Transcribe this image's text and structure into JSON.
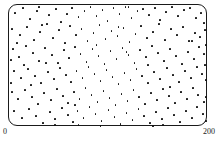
{
  "figure": {
    "kind": "scatter-plot",
    "frame_shape": "rounded-rectangle",
    "point_color": "#111111",
    "frame_color": "#1a1a1a",
    "background_color": "#ffffff"
  },
  "axis": {
    "x_min_label": "0",
    "x_max_label": "200"
  },
  "caption": {
    "text": "— —— · ——",
    "note": "cropped"
  },
  "chart_data": {
    "type": "scatter",
    "title": "",
    "xlabel": "",
    "ylabel": "",
    "xlim": [
      0,
      200
    ],
    "ylim": [
      0,
      122
    ],
    "grid": false,
    "legend": null,
    "tick_labels": {
      "x": [
        "0",
        "200"
      ],
      "y": []
    },
    "n_points": 232,
    "points": [
      [
        6,
        8
      ],
      [
        14,
        3
      ],
      [
        21,
        14
      ],
      [
        28,
        6
      ],
      [
        33,
        20
      ],
      [
        40,
        10
      ],
      [
        47,
        4
      ],
      [
        52,
        17
      ],
      [
        58,
        9
      ],
      [
        63,
        3
      ],
      [
        70,
        12
      ],
      [
        76,
        6
      ],
      [
        82,
        2
      ],
      [
        88,
        11
      ],
      [
        94,
        5
      ],
      [
        99,
        16
      ],
      [
        105,
        3
      ],
      [
        111,
        9
      ],
      [
        117,
        2
      ],
      [
        123,
        13
      ],
      [
        129,
        6
      ],
      [
        135,
        4
      ],
      [
        141,
        10
      ],
      [
        147,
        3
      ],
      [
        152,
        15
      ],
      [
        158,
        7
      ],
      [
        164,
        2
      ],
      [
        170,
        11
      ],
      [
        176,
        5
      ],
      [
        182,
        3
      ],
      [
        188,
        13
      ],
      [
        193,
        8
      ],
      [
        196,
        18
      ],
      [
        3,
        24
      ],
      [
        11,
        30
      ],
      [
        18,
        22
      ],
      [
        25,
        35
      ],
      [
        31,
        27
      ],
      [
        38,
        19
      ],
      [
        44,
        33
      ],
      [
        50,
        25
      ],
      [
        56,
        38
      ],
      [
        61,
        21
      ],
      [
        67,
        30
      ],
      [
        73,
        24
      ],
      [
        79,
        36
      ],
      [
        85,
        28
      ],
      [
        91,
        20
      ],
      [
        97,
        34
      ],
      [
        103,
        26
      ],
      [
        109,
        31
      ],
      [
        115,
        23
      ],
      [
        121,
        37
      ],
      [
        127,
        29
      ],
      [
        133,
        21
      ],
      [
        139,
        33
      ],
      [
        145,
        27
      ],
      [
        151,
        19
      ],
      [
        157,
        35
      ],
      [
        163,
        24
      ],
      [
        169,
        30
      ],
      [
        175,
        22
      ],
      [
        181,
        36
      ],
      [
        187,
        28
      ],
      [
        192,
        32
      ],
      [
        197,
        25
      ],
      [
        4,
        44
      ],
      [
        10,
        52
      ],
      [
        17,
        41
      ],
      [
        24,
        48
      ],
      [
        30,
        56
      ],
      [
        36,
        43
      ],
      [
        43,
        50
      ],
      [
        49,
        58
      ],
      [
        55,
        45
      ],
      [
        60,
        53
      ],
      [
        66,
        42
      ],
      [
        72,
        49
      ],
      [
        78,
        57
      ],
      [
        84,
        44
      ],
      [
        90,
        51
      ],
      [
        96,
        59
      ],
      [
        102,
        46
      ],
      [
        108,
        54
      ],
      [
        114,
        43
      ],
      [
        120,
        50
      ],
      [
        126,
        58
      ],
      [
        132,
        45
      ],
      [
        138,
        52
      ],
      [
        144,
        41
      ],
      [
        150,
        48
      ],
      [
        156,
        56
      ],
      [
        162,
        44
      ],
      [
        168,
        51
      ],
      [
        174,
        59
      ],
      [
        180,
        47
      ],
      [
        186,
        54
      ],
      [
        191,
        42
      ],
      [
        196,
        49
      ],
      [
        5,
        66
      ],
      [
        12,
        73
      ],
      [
        19,
        64
      ],
      [
        26,
        71
      ],
      [
        32,
        78
      ],
      [
        39,
        67
      ],
      [
        45,
        74
      ],
      [
        51,
        63
      ],
      [
        57,
        70
      ],
      [
        62,
        77
      ],
      [
        68,
        66
      ],
      [
        74,
        73
      ],
      [
        80,
        62
      ],
      [
        86,
        69
      ],
      [
        92,
        76
      ],
      [
        98,
        65
      ],
      [
        104,
        72
      ],
      [
        110,
        79
      ],
      [
        116,
        68
      ],
      [
        122,
        75
      ],
      [
        128,
        64
      ],
      [
        134,
        71
      ],
      [
        140,
        78
      ],
      [
        146,
        67
      ],
      [
        152,
        74
      ],
      [
        159,
        63
      ],
      [
        165,
        70
      ],
      [
        171,
        77
      ],
      [
        177,
        66
      ],
      [
        183,
        73
      ],
      [
        189,
        62
      ],
      [
        194,
        69
      ],
      [
        198,
        75
      ],
      [
        3,
        87
      ],
      [
        9,
        94
      ],
      [
        16,
        85
      ],
      [
        23,
        92
      ],
      [
        29,
        99
      ],
      [
        35,
        88
      ],
      [
        42,
        95
      ],
      [
        48,
        84
      ],
      [
        54,
        91
      ],
      [
        59,
        98
      ],
      [
        65,
        87
      ],
      [
        71,
        94
      ],
      [
        77,
        83
      ],
      [
        83,
        90
      ],
      [
        89,
        97
      ],
      [
        95,
        86
      ],
      [
        101,
        93
      ],
      [
        107,
        100
      ],
      [
        113,
        89
      ],
      [
        119,
        96
      ],
      [
        125,
        85
      ],
      [
        131,
        92
      ],
      [
        137,
        99
      ],
      [
        143,
        88
      ],
      [
        149,
        95
      ],
      [
        155,
        84
      ],
      [
        161,
        91
      ],
      [
        167,
        98
      ],
      [
        173,
        87
      ],
      [
        179,
        94
      ],
      [
        185,
        83
      ],
      [
        190,
        90
      ],
      [
        196,
        97
      ],
      [
        5,
        106
      ],
      [
        13,
        113
      ],
      [
        20,
        104
      ],
      [
        27,
        111
      ],
      [
        34,
        118
      ],
      [
        41,
        107
      ],
      [
        46,
        114
      ],
      [
        53,
        103
      ],
      [
        59,
        110
      ],
      [
        64,
        117
      ],
      [
        69,
        106
      ],
      [
        75,
        113
      ],
      [
        81,
        102
      ],
      [
        87,
        109
      ],
      [
        93,
        116
      ],
      [
        100,
        105
      ],
      [
        106,
        112
      ],
      [
        112,
        119
      ],
      [
        118,
        108
      ],
      [
        124,
        115
      ],
      [
        130,
        104
      ],
      [
        136,
        111
      ],
      [
        142,
        118
      ],
      [
        148,
        107
      ],
      [
        154,
        114
      ],
      [
        160,
        103
      ],
      [
        166,
        110
      ],
      [
        172,
        117
      ],
      [
        178,
        106
      ],
      [
        184,
        113
      ],
      [
        189,
        102
      ],
      [
        195,
        109
      ],
      [
        198,
        116
      ],
      [
        8,
        38
      ],
      [
        15,
        60
      ],
      [
        22,
        80
      ],
      [
        37,
        58
      ],
      [
        66,
        100
      ],
      [
        88,
        40
      ],
      [
        110,
        22
      ],
      [
        118,
        47
      ],
      [
        140,
        60
      ],
      [
        162,
        82
      ],
      [
        184,
        36
      ],
      [
        197,
        60
      ],
      [
        2,
        55
      ],
      [
        2,
        78
      ],
      [
        198,
        40
      ],
      [
        198,
        92
      ],
      [
        46,
        120
      ],
      [
        92,
        121
      ],
      [
        145,
        121
      ],
      [
        30,
        2
      ],
      [
        70,
        120
      ],
      [
        120,
        2
      ],
      [
        155,
        120
      ]
    ]
  }
}
